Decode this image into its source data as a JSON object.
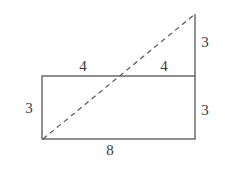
{
  "diagram": {
    "type": "geometry-figure",
    "colors": {
      "line": "#555555",
      "text": "#3a3a3a",
      "background": "#ffffff"
    },
    "labels": {
      "top_left_segment": "4",
      "top_right_segment": "4",
      "left_side": "3",
      "right_lower_side": "3",
      "right_upper_extension": "3",
      "bottom_side": "8"
    },
    "shapes": {
      "rectangle": {
        "width": 8,
        "height": 3
      },
      "extension": {
        "length": 3
      },
      "diagonal": {
        "style": "dashed",
        "from": "bottom-left corner",
        "to": "top of extension"
      }
    }
  }
}
